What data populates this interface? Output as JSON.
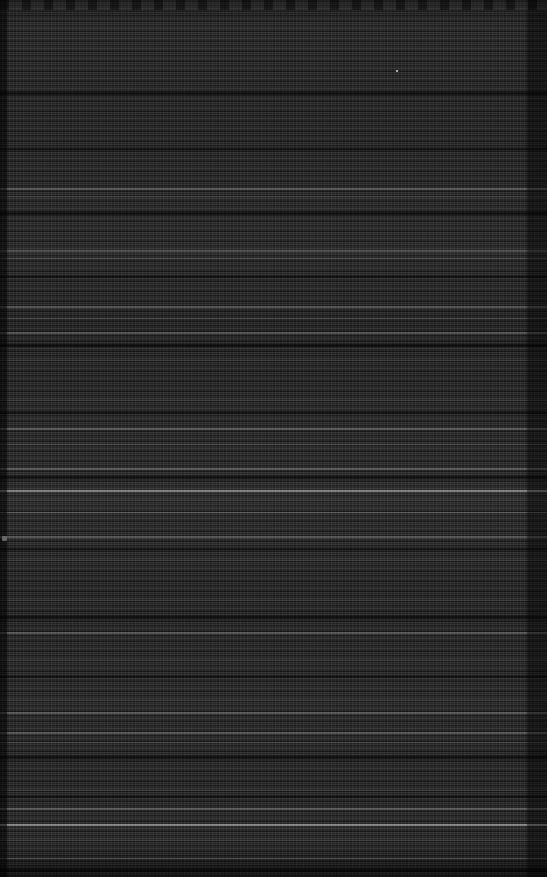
{
  "screen": {
    "width": 547,
    "height": 877,
    "state": "corrupted-render",
    "description": "Severely corrupted dark application window. The frame has collapsed into dense horizontal scanline noise; no text, icons or controls are legible at any zoom level.",
    "legible_text": "",
    "colors": {
      "background": "#272727",
      "background_dark": "#202020",
      "background_light": "#2f2f2f",
      "gutter": "#000000",
      "artifact_bright": "#ffffff"
    }
  },
  "regions": {
    "top_band": {
      "name": "top-header-band",
      "y": 0,
      "height": 13,
      "note": "slightly lighter band with irregular dark blobs along the very top edge"
    },
    "left_gutter": {
      "name": "left-gutter",
      "x": 0,
      "width": 7,
      "note": "narrow darker vertical strip down the full left edge"
    },
    "right_gutter": {
      "name": "right-gutter",
      "x": 527,
      "width": 20,
      "note": "darker vertical strip down the full right edge"
    },
    "content_field": {
      "name": "content-field",
      "x": 7,
      "y": 13,
      "width": 520,
      "height": 864,
      "note": "full-width striated field resembling collapsed rows of text; no column separators detected"
    }
  },
  "artifacts": {
    "bright_scanlines": [
      {
        "y": 188,
        "height": 2,
        "intensity": "soft"
      },
      {
        "y": 196,
        "height": 1,
        "intensity": "faint"
      },
      {
        "y": 250,
        "height": 2,
        "intensity": "soft"
      },
      {
        "y": 258,
        "height": 1,
        "intensity": "faint"
      },
      {
        "y": 306,
        "height": 2,
        "intensity": "soft"
      },
      {
        "y": 318,
        "height": 1,
        "intensity": "faint"
      },
      {
        "y": 332,
        "height": 2,
        "intensity": "soft"
      },
      {
        "y": 360,
        "height": 1,
        "intensity": "faint"
      },
      {
        "y": 400,
        "height": 1,
        "intensity": "faint"
      },
      {
        "y": 428,
        "height": 2,
        "intensity": "soft"
      },
      {
        "y": 444,
        "height": 1,
        "intensity": "faint"
      },
      {
        "y": 468,
        "height": 2,
        "intensity": "soft"
      },
      {
        "y": 490,
        "height": 2,
        "intensity": "bright"
      },
      {
        "y": 500,
        "height": 1,
        "intensity": "faint"
      },
      {
        "y": 512,
        "height": 1,
        "intensity": "soft"
      },
      {
        "y": 536,
        "height": 2,
        "intensity": "soft"
      },
      {
        "y": 560,
        "height": 1,
        "intensity": "faint"
      },
      {
        "y": 600,
        "height": 1,
        "intensity": "faint"
      },
      {
        "y": 632,
        "height": 2,
        "intensity": "soft"
      },
      {
        "y": 660,
        "height": 1,
        "intensity": "faint"
      },
      {
        "y": 700,
        "height": 1,
        "intensity": "faint"
      },
      {
        "y": 712,
        "height": 2,
        "intensity": "soft"
      },
      {
        "y": 732,
        "height": 2,
        "intensity": "soft"
      },
      {
        "y": 742,
        "height": 1,
        "intensity": "faint"
      },
      {
        "y": 790,
        "height": 1,
        "intensity": "faint"
      },
      {
        "y": 808,
        "height": 2,
        "intensity": "soft"
      },
      {
        "y": 824,
        "height": 2,
        "intensity": "bright"
      },
      {
        "y": 840,
        "height": 1,
        "intensity": "faint"
      },
      {
        "y": 858,
        "height": 1,
        "intensity": "soft"
      }
    ],
    "dark_bands": [
      {
        "y": 92,
        "height": 3
      },
      {
        "y": 148,
        "height": 2
      },
      {
        "y": 212,
        "height": 3
      },
      {
        "y": 276,
        "height": 2
      },
      {
        "y": 344,
        "height": 3
      },
      {
        "y": 412,
        "height": 2
      },
      {
        "y": 476,
        "height": 3
      },
      {
        "y": 548,
        "height": 2
      },
      {
        "y": 616,
        "height": 3
      },
      {
        "y": 676,
        "height": 2
      },
      {
        "y": 756,
        "height": 3
      },
      {
        "y": 796,
        "height": 2
      },
      {
        "y": 868,
        "height": 4
      }
    ],
    "specks": [
      {
        "name": "bright-speck-left",
        "x": 2,
        "y": 536,
        "width": 5,
        "height": 5
      },
      {
        "name": "bright-speck-upper-right",
        "x": 396,
        "y": 70,
        "width": 2,
        "height": 2
      }
    ]
  }
}
